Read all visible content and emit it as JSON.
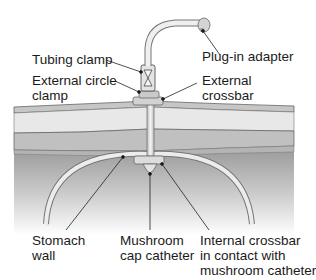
{
  "diagram": {
    "type": "medical-illustration",
    "labels": {
      "tubing_clamp": "Tubing clamp",
      "plug_in_adapter": "Plug-in adapter",
      "external_circle_clamp_line1": "External circle",
      "external_circle_clamp_line2": "clamp",
      "external_crossbar_line1": "External",
      "external_crossbar_line2": "crossbar",
      "stomach_wall_line1": "Stomach",
      "stomach_wall_line2": "wall",
      "mushroom_cap_line1": "Mushroom",
      "mushroom_cap_line2": "cap catheter",
      "internal_crossbar_line1": "Internal crossbar",
      "internal_crossbar_line2": "in contact with",
      "internal_crossbar_line3": "mushroom catheter"
    },
    "colors": {
      "background": "#ffffff",
      "outline": "#555555",
      "skin_top": "#c8c8c8",
      "fat_layer": "#e6e6e6",
      "muscle_layer": "#bdbdbd",
      "device": "#d0d0d0",
      "stomach_gradient_top": "#9a9a9a",
      "stomach_gradient_bottom": "#ffffff"
    }
  }
}
